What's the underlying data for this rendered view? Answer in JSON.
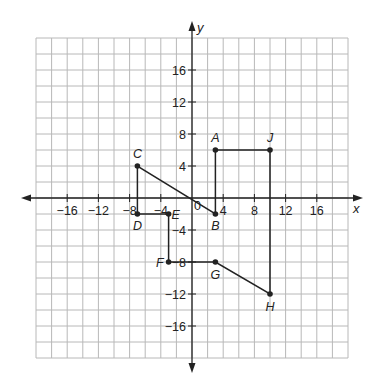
{
  "diagram": {
    "type": "coordinate-plane",
    "x_axis_label": "x",
    "y_axis_label": "y",
    "origin_label": "0",
    "range": {
      "xmin": -20,
      "xmax": 20,
      "ymin": -20,
      "ymax": 20
    },
    "grid_step": 2,
    "x_ticks": [
      {
        "value": -16,
        "label": "−16"
      },
      {
        "value": -12,
        "label": "−12"
      },
      {
        "value": -8,
        "label": "−8"
      },
      {
        "value": -4,
        "label": "−4"
      },
      {
        "value": 4,
        "label": "4"
      },
      {
        "value": 8,
        "label": "8"
      },
      {
        "value": 12,
        "label": "12"
      },
      {
        "value": 16,
        "label": "16"
      }
    ],
    "y_ticks": [
      {
        "value": 16,
        "label": "16"
      },
      {
        "value": 12,
        "label": "12"
      },
      {
        "value": 8,
        "label": "8"
      },
      {
        "value": 4,
        "label": "4"
      },
      {
        "value": -4,
        "label": "−4"
      },
      {
        "value": -8,
        "label": "−8"
      },
      {
        "value": -12,
        "label": "−12"
      },
      {
        "value": -16,
        "label": "−16"
      }
    ],
    "points": [
      {
        "name": "A",
        "x": 3,
        "y": 6
      },
      {
        "name": "B",
        "x": 3,
        "y": -2
      },
      {
        "name": "C",
        "x": -7,
        "y": 4
      },
      {
        "name": "D",
        "x": -7,
        "y": -2
      },
      {
        "name": "E",
        "x": -3,
        "y": -2
      },
      {
        "name": "F",
        "x": -3,
        "y": -8
      },
      {
        "name": "G",
        "x": 3,
        "y": -8
      },
      {
        "name": "H",
        "x": 10,
        "y": -12
      },
      {
        "name": "J",
        "x": 10,
        "y": 6
      }
    ],
    "path_order": [
      "A",
      "B",
      "C",
      "D",
      "E",
      "F",
      "G",
      "H",
      "J",
      "A"
    ],
    "colors": {
      "line": "#222222",
      "grid": "#b8b8b8",
      "background": "#ffffff"
    }
  }
}
